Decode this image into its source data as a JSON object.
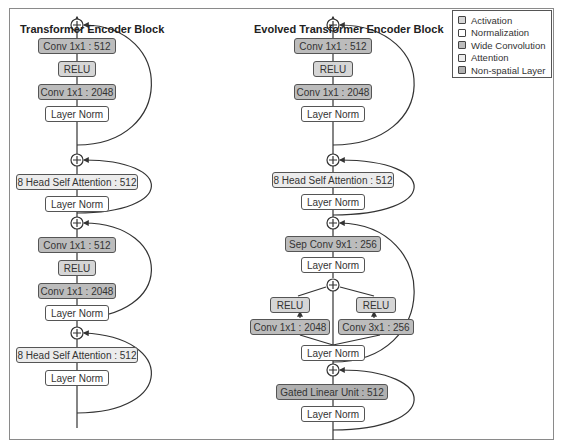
{
  "diagram": {
    "left": {
      "title": "Transformer Encoder Block",
      "layers_top_to_bottom": [
        {
          "label": "Conv 1x1 : 512",
          "type": "wide"
        },
        {
          "label": "RELU",
          "type": "act"
        },
        {
          "label": "Conv 1x1 : 2048",
          "type": "wide"
        },
        {
          "label": "Layer Norm",
          "type": "norm"
        },
        {
          "label": "8 Head Self Attention : 512",
          "type": "attn"
        },
        {
          "label": "Layer Norm",
          "type": "norm"
        },
        {
          "label": "Conv 1x1 : 512",
          "type": "wide"
        },
        {
          "label": "RELU",
          "type": "act"
        },
        {
          "label": "Conv 1x1 : 2048",
          "type": "wide"
        },
        {
          "label": "Layer Norm",
          "type": "norm"
        },
        {
          "label": "8 Head Self Attention : 512",
          "type": "attn"
        },
        {
          "label": "Layer Norm",
          "type": "norm"
        }
      ]
    },
    "right": {
      "title": "Evolved Transformer Encoder Block",
      "layers_top_to_bottom": [
        {
          "label": "Conv 1x1 : 512",
          "type": "wide"
        },
        {
          "label": "RELU",
          "type": "act"
        },
        {
          "label": "Conv 1x1 : 2048",
          "type": "wide"
        },
        {
          "label": "Layer Norm",
          "type": "norm"
        },
        {
          "label": "8 Head Self Attention : 512",
          "type": "attn"
        },
        {
          "label": "Layer Norm",
          "type": "norm"
        },
        {
          "label": "Sep Conv 9x1 : 256",
          "type": "wide"
        },
        {
          "label": "Layer Norm",
          "type": "norm"
        },
        {
          "label": "RELU",
          "type": "act",
          "branch": "left"
        },
        {
          "label": "RELU",
          "type": "act",
          "branch": "right"
        },
        {
          "label": "Conv 1x1 : 2048",
          "type": "wide",
          "branch": "left"
        },
        {
          "label": "Conv 3x1 : 256",
          "type": "wide",
          "branch": "right"
        },
        {
          "label": "Layer Norm",
          "type": "norm"
        },
        {
          "label": "Gated Linear Unit : 512",
          "type": "nonsp"
        },
        {
          "label": "Layer Norm",
          "type": "norm"
        }
      ]
    },
    "legend": [
      {
        "label": "Activation",
        "color": "#d6d6d6"
      },
      {
        "label": "Normalization",
        "color": "#ffffff"
      },
      {
        "label": "Wide Convolution",
        "color": "#bcbcbc"
      },
      {
        "label": "Attention",
        "color": "#ececec"
      },
      {
        "label": "Non-spatial Layer",
        "color": "#b0b0b0"
      }
    ],
    "add_symbol": "+"
  }
}
